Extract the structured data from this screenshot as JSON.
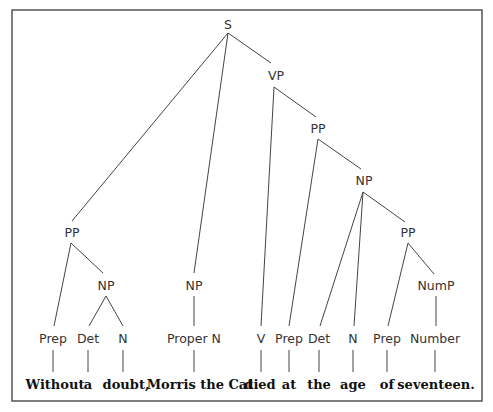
{
  "diagram": {
    "type": "syntax-tree",
    "sentence": "Without a doubt, Morris the Cat died at the age of seventeen.",
    "nodes": {
      "s": {
        "label": "S"
      },
      "vp": {
        "label": "VP"
      },
      "pp_vp": {
        "label": "PP"
      },
      "np_vp": {
        "label": "NP"
      },
      "pp_np": {
        "label": "PP"
      },
      "nump": {
        "label": "NumP"
      },
      "pp_left": {
        "label": "PP"
      },
      "np_left": {
        "label": "NP"
      },
      "np_subj": {
        "label": "NP"
      },
      "prep1": {
        "label": "Prep"
      },
      "det1": {
        "label": "Det"
      },
      "n1": {
        "label": "N"
      },
      "propern": {
        "label": "Proper N"
      },
      "v": {
        "label": "V"
      },
      "prep2": {
        "label": "Prep"
      },
      "det2": {
        "label": "Det"
      },
      "n2": {
        "label": "N"
      },
      "prep3": {
        "label": "Prep"
      },
      "number": {
        "label": "Number"
      }
    },
    "words": {
      "w1": "Without",
      "w2": "a",
      "w3": "doubt,",
      "w4": "Morris the Cat",
      "w5": "died",
      "w6": "at",
      "w7": "the",
      "w8": "age",
      "w9": "of",
      "w10": "seventeen."
    },
    "edges": [
      [
        "S",
        "PP"
      ],
      [
        "S",
        "NP"
      ],
      [
        "S",
        "VP"
      ],
      [
        "PP",
        "Prep"
      ],
      [
        "PP",
        "NP"
      ],
      [
        "NP",
        "Det"
      ],
      [
        "NP",
        "N"
      ],
      [
        "NP",
        "Proper N"
      ],
      [
        "VP",
        "V"
      ],
      [
        "VP",
        "PP"
      ],
      [
        "PP",
        "Prep"
      ],
      [
        "PP",
        "NP"
      ],
      [
        "NP",
        "Det"
      ],
      [
        "NP",
        "N"
      ],
      [
        "NP",
        "PP"
      ],
      [
        "PP",
        "Prep"
      ],
      [
        "PP",
        "NumP"
      ],
      [
        "NumP",
        "Number"
      ]
    ]
  }
}
